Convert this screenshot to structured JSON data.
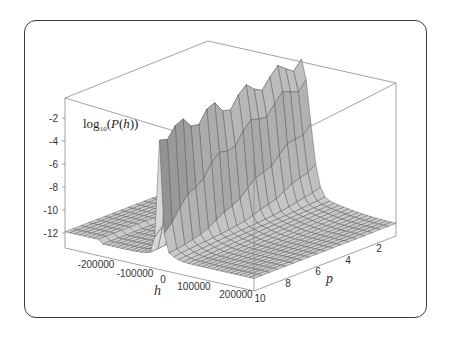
{
  "chart_data": {
    "type": "surface3d",
    "title": "",
    "zlabel": "log10(P(h))",
    "zlabel_parts": {
      "prefix": "log",
      "sub": "10",
      "open": "(",
      "func": "P",
      "arg": "h",
      "close": "))"
    },
    "xlabel": "h",
    "ylabel": "p",
    "x_ticks": [
      "-200000",
      "-100000",
      "0",
      "100000",
      "200000"
    ],
    "y_ticks": [
      "2",
      "4",
      "6",
      "8",
      "10"
    ],
    "z_ticks": [
      "-2",
      "-4",
      "-6",
      "-8",
      "-10",
      "-12"
    ],
    "xlim": [
      -250000,
      250000
    ],
    "ylim": [
      1,
      10
    ],
    "zlim": [
      -13,
      -1
    ],
    "grid": false,
    "surface_color": "#b8b8b8",
    "edge_color": "#555555",
    "ridge_profile": {
      "p": [
        10,
        9,
        8,
        7,
        6,
        5,
        4,
        3,
        2,
        1
      ],
      "peak_log10P": [
        -3.2,
        -3.0,
        -3.1,
        -2.6,
        -2.9,
        -2.4,
        -2.2,
        -1.9,
        -1.6,
        -1.4
      ]
    },
    "tails_log10P": -12
  },
  "labels": {
    "z_axis": "log10(P(h))",
    "x_axis": "h",
    "y_axis": "p"
  }
}
